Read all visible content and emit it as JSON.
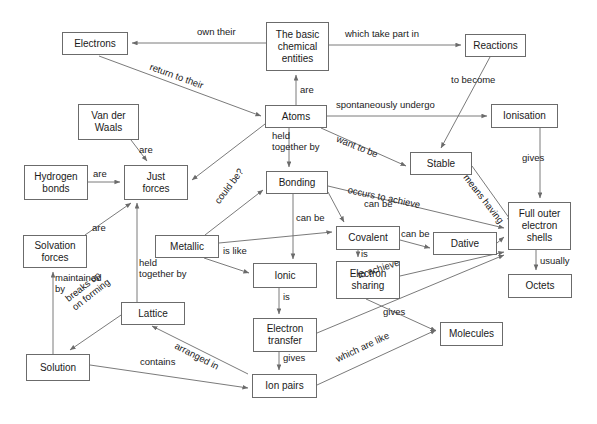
{
  "diagram": {
    "type": "concept-map",
    "stroke_color": "#6b6b6b",
    "text_color": "#1a1a1a",
    "background": "#ffffff",
    "nodes": [
      {
        "id": "electrons",
        "label": "Electrons",
        "x": 62,
        "y": 32,
        "w": 66,
        "h": 23
      },
      {
        "id": "basic_entities",
        "label": "The basic\nchemical\nentities",
        "x": 266,
        "y": 22,
        "w": 63,
        "h": 49
      },
      {
        "id": "reactions",
        "label": "Reactions",
        "x": 465,
        "y": 34,
        "w": 61,
        "h": 23
      },
      {
        "id": "van_der_waals",
        "label": "Van der\nWaals",
        "x": 78,
        "y": 104,
        "w": 61,
        "h": 36
      },
      {
        "id": "atoms",
        "label": "Atoms",
        "x": 265,
        "y": 105,
        "w": 62,
        "h": 23
      },
      {
        "id": "ionisation",
        "label": "Ionisation",
        "x": 491,
        "y": 104,
        "w": 67,
        "h": 24
      },
      {
        "id": "stable",
        "label": "Stable",
        "x": 410,
        "y": 152,
        "w": 62,
        "h": 23
      },
      {
        "id": "hydrogen_bonds",
        "label": "Hydrogen\nbonds",
        "x": 24,
        "y": 165,
        "w": 64,
        "h": 35
      },
      {
        "id": "just_forces",
        "label": "Just\nforces",
        "x": 124,
        "y": 165,
        "w": 64,
        "h": 35
      },
      {
        "id": "bonding",
        "label": "Bonding",
        "x": 266,
        "y": 171,
        "w": 62,
        "h": 23
      },
      {
        "id": "full_outer",
        "label": "Full outer\nelectron\nshells",
        "x": 508,
        "y": 202,
        "w": 63,
        "h": 48
      },
      {
        "id": "covalent",
        "label": "Covalent",
        "x": 336,
        "y": 226,
        "w": 64,
        "h": 24
      },
      {
        "id": "solvation",
        "label": "Solvation\nforces",
        "x": 23,
        "y": 235,
        "w": 64,
        "h": 33
      },
      {
        "id": "metallic",
        "label": "Metallic",
        "x": 155,
        "y": 235,
        "w": 64,
        "h": 23
      },
      {
        "id": "dative",
        "label": "Dative",
        "x": 433,
        "y": 232,
        "w": 64,
        "h": 23
      },
      {
        "id": "electron_shar",
        "label": "Electron\nsharing",
        "x": 336,
        "y": 261,
        "w": 64,
        "h": 38
      },
      {
        "id": "ionic",
        "label": "Ionic",
        "x": 253,
        "y": 263,
        "w": 64,
        "h": 25
      },
      {
        "id": "octets",
        "label": "Octets",
        "x": 508,
        "y": 274,
        "w": 64,
        "h": 24
      },
      {
        "id": "lattice",
        "label": "Lattice",
        "x": 121,
        "y": 302,
        "w": 64,
        "h": 23
      },
      {
        "id": "electron_trans",
        "label": "Electron\ntransfer",
        "x": 253,
        "y": 318,
        "w": 64,
        "h": 34
      },
      {
        "id": "molecules",
        "label": "Molecules",
        "x": 440,
        "y": 322,
        "w": 63,
        "h": 24
      },
      {
        "id": "solution",
        "label": "Solution",
        "x": 26,
        "y": 354,
        "w": 64,
        "h": 27
      },
      {
        "id": "ion_pairs",
        "label": "Ion pairs",
        "x": 252,
        "y": 374,
        "w": 65,
        "h": 24
      }
    ],
    "edges": [
      {
        "id": "e1",
        "from": "basic_entities",
        "to": "electrons",
        "label": "own their",
        "path": "M 266 43 L 132 43",
        "lx": 197,
        "ly": 26,
        "rot": 0
      },
      {
        "id": "e2",
        "from": "basic_entities",
        "to": "reactions",
        "label": "which take part in",
        "path": "M 329 45 L 461 45",
        "lx": 345,
        "ly": 28,
        "rot": 0
      },
      {
        "id": "e3",
        "from": "electrons",
        "to": "atoms",
        "label": "return to their",
        "path": "M 99 56 L 261 116",
        "lx": 152,
        "ly": 61,
        "rot": 20
      },
      {
        "id": "e4",
        "from": "atoms",
        "to": "basic_entities",
        "label": "are",
        "path": "M 296 105 L 296 75",
        "lx": 300,
        "ly": 84,
        "rot": 0
      },
      {
        "id": "e5",
        "from": "reactions",
        "to": "stable",
        "label": "to become",
        "path": "M 490 57 L 441 148",
        "lx": 451,
        "ly": 74,
        "rot": 0
      },
      {
        "id": "e6",
        "from": "atoms",
        "to": "ionisation",
        "label": "spontaneously undergo",
        "path": "M 327 116 L 487 116",
        "lx": 336,
        "ly": 99,
        "rot": 0
      },
      {
        "id": "e7",
        "from": "atoms",
        "to": "just_forces",
        "label": "held\ntogether by",
        "path": "M 265 124 L 192 180",
        "lx": 272,
        "ly": 130,
        "rot": 0
      },
      {
        "id": "e8",
        "from": "atoms",
        "to": "stable",
        "label": "want to be",
        "path": "M 321 128 L 406 166",
        "lx": 339,
        "ly": 133,
        "rot": 22
      },
      {
        "id": "e9",
        "from": "atoms",
        "to": "bonding",
        "label": "",
        "path": "M 289 128 L 289 167",
        "lx": 0,
        "ly": 0,
        "rot": 0
      },
      {
        "id": "e10",
        "from": "van_der_waals",
        "to": "just_forces",
        "label": "are",
        "path": "M 131 140 L 147 161",
        "lx": 139,
        "ly": 144,
        "rot": 0
      },
      {
        "id": "e11",
        "from": "hydrogen_bonds",
        "to": "just_forces",
        "label": "are",
        "path": "M 88 182 L 120 182",
        "lx": 93,
        "ly": 168,
        "rot": 0
      },
      {
        "id": "e12",
        "from": "ionisation",
        "to": "full_outer",
        "label": "gives",
        "path": "M 540 128 L 540 198",
        "lx": 522,
        "ly": 152,
        "rot": 0
      },
      {
        "id": "e13",
        "from": "stable",
        "to": "full_outer",
        "label": "means having",
        "path": "M 472 166 L 512 222",
        "lx": 470,
        "ly": 172,
        "rot": 52
      },
      {
        "id": "e14",
        "from": "bonding",
        "to": "full_outer",
        "label": "occurs to achieve",
        "path": "M 328 186 L 504 228",
        "lx": 349,
        "ly": 184,
        "rot": 12
      },
      {
        "id": "e15",
        "from": "metallic",
        "to": "bonding",
        "label": "could be?",
        "path": "M 205 235 L 263 190",
        "lx": 212,
        "ly": 199,
        "rot": -53
      },
      {
        "id": "e16",
        "from": "bonding",
        "to": "covalent",
        "label": "can be",
        "path": "M 328 192 L 344 222",
        "lx": 364,
        "ly": 198,
        "rot": 0
      },
      {
        "id": "e17",
        "from": "solvation",
        "to": "just_forces",
        "label": "are",
        "path": "M 85 235 L 131 203",
        "lx": 92,
        "ly": 222,
        "rot": 0
      },
      {
        "id": "e18",
        "from": "bonding",
        "to": "ionic",
        "label": "can be",
        "path": "M 293 194 L 293 259",
        "lx": 296,
        "ly": 212,
        "rot": 0
      },
      {
        "id": "e19",
        "from": "metallic",
        "to": "covalent",
        "label": "is like",
        "path": "M 219 243 L 332 232",
        "lx": 223,
        "ly": 245,
        "rot": 0
      },
      {
        "id": "e20",
        "from": "metallic",
        "to": "ionic",
        "label": "",
        "path": "M 204 258 L 249 273",
        "lx": 0,
        "ly": 0,
        "rot": 0
      },
      {
        "id": "e21",
        "from": "covalent",
        "to": "dative",
        "label": "can be",
        "path": "M 400 240 L 430 248",
        "lx": 401,
        "ly": 228,
        "rot": 0
      },
      {
        "id": "e22",
        "from": "covalent",
        "to": "electron_shar",
        "label": "is",
        "path": "M 358 250 L 358 257",
        "lx": 361,
        "ly": 248,
        "rot": 0
      },
      {
        "id": "e23",
        "from": "lattice",
        "to": "just_forces",
        "label": "held\ntogether by",
        "path": "M 137 302 L 137 203",
        "lx": 139,
        "ly": 257,
        "rot": 0
      },
      {
        "id": "e24",
        "from": "full_outer",
        "to": "octets",
        "label": "usually",
        "path": "M 536 250 L 536 270",
        "lx": 540,
        "ly": 255,
        "rot": 0
      },
      {
        "id": "e25",
        "from": "dative",
        "to": "full_outer",
        "label": "",
        "path": "M 497 243 L 504 237",
        "lx": 0,
        "ly": 0,
        "rot": 0
      },
      {
        "id": "e26",
        "from": "ionic",
        "to": "electron_trans",
        "label": "is",
        "path": "M 279 288 L 279 314",
        "lx": 283,
        "ly": 291,
        "rot": 0
      },
      {
        "id": "e27",
        "from": "electron_shar",
        "to": "full_outer",
        "label": "to achieve",
        "path": "M 400 276 L 504 252",
        "lx": 356,
        "ly": 270,
        "rot": -18
      },
      {
        "id": "e28",
        "from": "electron_shar",
        "to": "molecules",
        "label": "gives",
        "path": "M 366 299 L 436 331",
        "lx": 383,
        "ly": 306,
        "rot": 0
      },
      {
        "id": "e29",
        "from": "solvation",
        "to": "lattice",
        "label": "maintained\nby",
        "path": "M 53 354 L 53 272",
        "lx": 55,
        "ly": 272,
        "rot": 0
      },
      {
        "id": "e30",
        "from": "lattice",
        "to": "solution",
        "label": "breaks up\non forming",
        "path": "M 124 313 L 70 350",
        "lx": 63,
        "ly": 295,
        "rot": -38
      },
      {
        "id": "e31",
        "from": "ion_pairs",
        "to": "lattice",
        "label": "arranged in",
        "path": "M 248 374 L 152 326",
        "lx": 178,
        "ly": 340,
        "rot": 27
      },
      {
        "id": "e32",
        "from": "electron_trans",
        "to": "ion_pairs",
        "label": "gives",
        "path": "M 279 352 L 279 370",
        "lx": 283,
        "ly": 352,
        "rot": 0
      },
      {
        "id": "e33",
        "from": "electron_trans",
        "to": "full_outer",
        "label": "",
        "path": "M 317 333 L 504 255",
        "lx": 0,
        "ly": 0,
        "rot": 0
      },
      {
        "id": "e34",
        "from": "solution",
        "to": "ion_pairs",
        "label": "contains",
        "path": "M 90 365 L 248 388",
        "lx": 140,
        "ly": 356,
        "rot": 0
      },
      {
        "id": "e35",
        "from": "ion_pairs",
        "to": "molecules",
        "label": "which are like",
        "path": "M 317 385 L 436 330",
        "lx": 334,
        "ly": 354,
        "rot": -25
      }
    ]
  }
}
